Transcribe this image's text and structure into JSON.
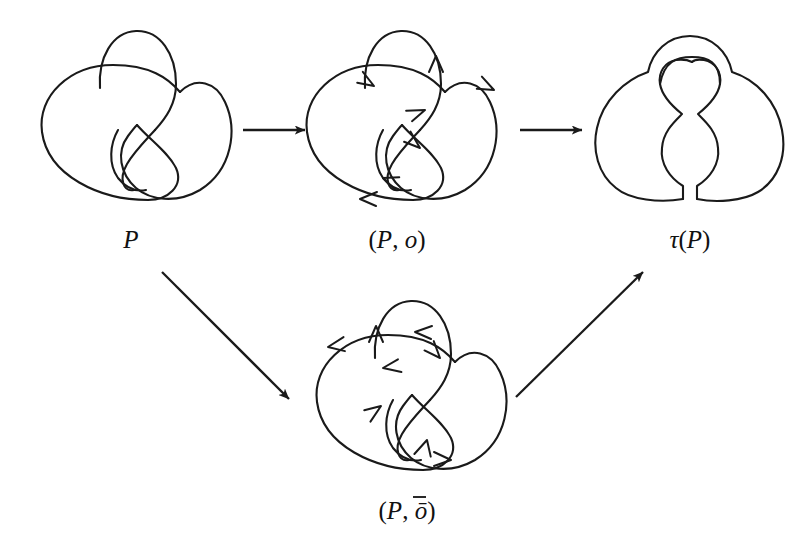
{
  "figure": {
    "background_color": "#ffffff",
    "stroke_color": "#1a1a1a",
    "width": 809,
    "height": 546
  },
  "nodes": [
    {
      "id": "P",
      "label": "P",
      "label_x": 131,
      "label_y": 248,
      "description": "unoriented knot diagram P with two crossings",
      "center_x": 135,
      "center_y": 130
    },
    {
      "id": "P_o",
      "label": "(P, o)",
      "label_x": 397,
      "label_y": 248,
      "description": "knot diagram P with orientation o, arrows clockwise on outer circle",
      "center_x": 400,
      "center_y": 130
    },
    {
      "id": "P_obar",
      "label": "(P, ō)",
      "label_x": 407,
      "label_y": 519,
      "description": "knot diagram P with reversed orientation o-bar",
      "center_x": 410,
      "center_y": 400
    },
    {
      "id": "tau_P",
      "label": "τ(P)",
      "label_x": 690,
      "label_y": 248,
      "description": "smoothed resolution tau of P, crossings replaced by parallel strands",
      "center_x": 690,
      "center_y": 130
    }
  ],
  "edges": [
    {
      "id": "P-to-Po",
      "from": "P",
      "to": "P_o",
      "kind": "straight-arrow",
      "x1": 243,
      "y1": 130,
      "x2": 305,
      "y2": 130
    },
    {
      "id": "Po-to-tauP",
      "from": "P_o",
      "to": "tau_P",
      "kind": "straight-arrow",
      "x1": 520,
      "y1": 130,
      "x2": 582,
      "y2": 130
    },
    {
      "id": "P-to-Pobar",
      "from": "P",
      "to": "P_obar",
      "kind": "straight-arrow",
      "x1": 162,
      "y1": 272,
      "x2": 289,
      "y2": 399
    },
    {
      "id": "Pobar-to-tauP",
      "from": "P_obar",
      "to": "tau_P",
      "kind": "straight-arrow",
      "x1": 516,
      "y1": 397,
      "x2": 643,
      "y2": 272
    }
  ],
  "captions": {
    "p": "P",
    "p_o_open": "(",
    "p_o_p": "P",
    "p_o_comma": ", ",
    "p_o_o": "o",
    "p_o_close": ")",
    "p_obar_o": "ō",
    "tau": "τ",
    "tau_open": "(",
    "tau_p": "P",
    "tau_close": ")"
  },
  "orientations": {
    "o": {
      "name": "o",
      "arrow_count": 6,
      "outer_direction": "clockwise",
      "description": "six orientation arrowheads distributed along the strands"
    },
    "o_bar": {
      "name": "ō",
      "arrow_count": 6,
      "outer_direction": "counterclockwise",
      "description": "six orientation arrowheads reversed relative to o"
    }
  }
}
